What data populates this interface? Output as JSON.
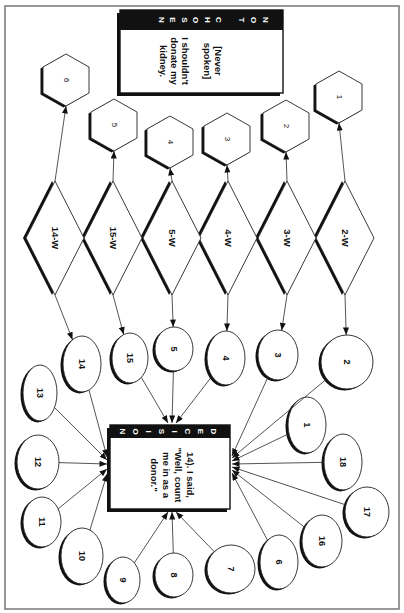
{
  "colors": {
    "ink": "#111111",
    "background": "#ffffff",
    "frame": "#777777"
  },
  "not_chosen": {
    "header": "NOT CHOSEN",
    "lines": [
      "[Never",
      "spoken]",
      "",
      "I shouldn't",
      "donate my",
      "kidney."
    ]
  },
  "decision": {
    "header": "DECISION",
    "lines": [
      "14). I said,",
      "\"Well, count",
      "me in as a",
      "donor.\""
    ]
  },
  "hexagons": [
    {
      "id": "h1",
      "label": "1"
    },
    {
      "id": "h2",
      "label": "2"
    },
    {
      "id": "h3",
      "label": "3"
    },
    {
      "id": "h4",
      "label": "4"
    },
    {
      "id": "h5",
      "label": "5"
    },
    {
      "id": "h6",
      "label": "6"
    }
  ],
  "diamonds": [
    {
      "id": "d2w",
      "label": "2-W",
      "to_hexagon": "h1",
      "to_circle": "c2"
    },
    {
      "id": "d3w",
      "label": "3-W",
      "to_hexagon": "h2",
      "to_circle": "c3"
    },
    {
      "id": "d4w",
      "label": "4-W",
      "to_hexagon": "h3",
      "to_circle": "c4"
    },
    {
      "id": "d5w",
      "label": "5-W",
      "to_hexagon": "h4",
      "to_circle": "c5"
    },
    {
      "id": "d15w",
      "label": "15-W",
      "to_hexagon": "h5",
      "to_circle": "c15"
    },
    {
      "id": "d14w",
      "label": "14-W",
      "to_hexagon": "h6",
      "to_circle": "c14"
    }
  ],
  "circles": [
    {
      "id": "c1",
      "label": "1"
    },
    {
      "id": "c2",
      "label": "2"
    },
    {
      "id": "c3",
      "label": "3"
    },
    {
      "id": "c4",
      "label": "4"
    },
    {
      "id": "c5",
      "label": "5"
    },
    {
      "id": "c6",
      "label": "6"
    },
    {
      "id": "c7",
      "label": "7"
    },
    {
      "id": "c8",
      "label": "8"
    },
    {
      "id": "c9",
      "label": "9"
    },
    {
      "id": "c10",
      "label": "10"
    },
    {
      "id": "c11",
      "label": "11"
    },
    {
      "id": "c12",
      "label": "12"
    },
    {
      "id": "c13",
      "label": "13"
    },
    {
      "id": "c14",
      "label": "14"
    },
    {
      "id": "c15",
      "label": "15"
    },
    {
      "id": "c16",
      "label": "16"
    },
    {
      "id": "c17",
      "label": "17"
    },
    {
      "id": "c18",
      "label": "18"
    }
  ],
  "decision_inputs": [
    "c1",
    "c2",
    "c3",
    "c4",
    "c5",
    "c6",
    "c7",
    "c8",
    "c9",
    "c10",
    "c11",
    "c12",
    "c13",
    "c14",
    "c15",
    "c16",
    "c17",
    "c18"
  ]
}
